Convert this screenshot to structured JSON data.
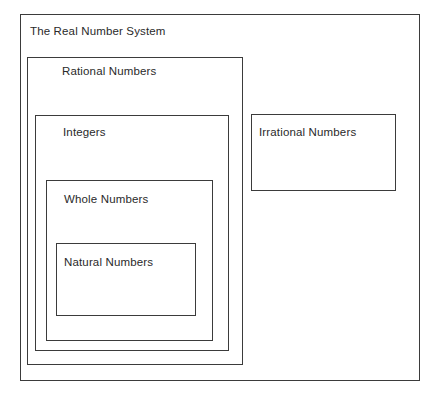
{
  "diagram": {
    "title": "The Real Number System",
    "type": "nested-set-venn-rectangles",
    "background_color": "#ffffff",
    "line_color": "#3b3b3b",
    "text_color": "#2a2a2a",
    "sets": [
      {
        "id": "real",
        "label": "The Real Number System",
        "level": 0,
        "parent": null
      },
      {
        "id": "rational",
        "label": "Rational Numbers",
        "level": 1,
        "parent": "real"
      },
      {
        "id": "integers",
        "label": "Integers",
        "level": 2,
        "parent": "rational"
      },
      {
        "id": "whole",
        "label": "Whole Numbers",
        "level": 3,
        "parent": "integers"
      },
      {
        "id": "natural",
        "label": "Natural Numbers",
        "level": 4,
        "parent": "whole"
      },
      {
        "id": "irrational",
        "label": "Irrational Numbers",
        "level": 1,
        "parent": "real"
      }
    ]
  }
}
